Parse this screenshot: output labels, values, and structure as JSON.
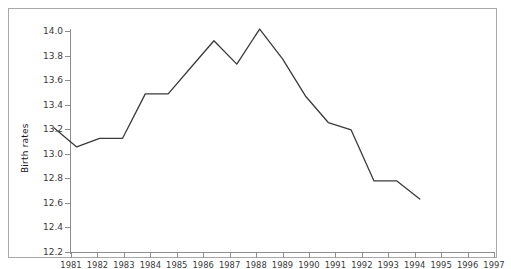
{
  "chart_data": {
    "type": "line",
    "title": "",
    "xlabel": "",
    "ylabel": "Birth rates",
    "categories": [
      "1981",
      "1982",
      "1983",
      "1984",
      "1985",
      "1986",
      "1987",
      "1988",
      "1989",
      "1990",
      "1991",
      "1992",
      "1993",
      "1994",
      "1995",
      "1996",
      "1997"
    ],
    "values": [
      13.0,
      12.82,
      12.9,
      12.9,
      13.32,
      13.32,
      13.57,
      13.82,
      13.6,
      13.93,
      13.65,
      13.3,
      13.05,
      12.98,
      12.5,
      12.5,
      12.33
    ],
    "series": [
      {
        "name": "Birth rates",
        "values": [
          13.0,
          12.82,
          12.9,
          12.9,
          13.32,
          13.32,
          13.57,
          13.82,
          13.6,
          13.93,
          13.65,
          13.3,
          13.05,
          12.98,
          12.5,
          12.5,
          12.33
        ]
      }
    ],
    "ylim": [
      12.2,
      14.0
    ],
    "ytick_step": 0.2,
    "yticks": [
      "14.0",
      "13.8",
      "13.6",
      "13.4",
      "13.2",
      "13.0",
      "12.8",
      "12.6",
      "12.4",
      "12.2"
    ],
    "grid": false,
    "legend": "none",
    "line_color": "#3a3a3a",
    "axis_color": "#8d8d8d",
    "border_color": "#a8a8a8",
    "background": "#ffffff"
  }
}
